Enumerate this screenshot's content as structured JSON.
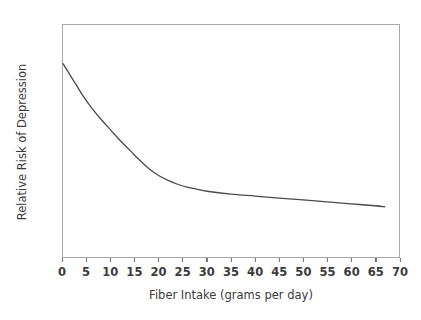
{
  "chart_data": {
    "type": "line",
    "title": "",
    "xlabel": "Fiber Intake (grams per day)",
    "ylabel": "Relative Risk of Depression",
    "xlim": [
      0,
      70
    ],
    "ylim": [
      0.0,
      1.2
    ],
    "xticks": [
      0,
      5,
      10,
      15,
      20,
      25,
      30,
      35,
      40,
      45,
      50,
      55,
      60,
      65,
      70
    ],
    "yticks": [
      "0.0",
      "0.1",
      "0.2",
      "0.3",
      "0.4",
      "0.5",
      "0.6",
      "0.7",
      "0.8",
      "0.9",
      "1.0",
      "1.1",
      "1.2"
    ],
    "xtick_labels": [
      "0",
      "5",
      "10",
      "15",
      "20",
      "25",
      "30",
      "35",
      "40",
      "45",
      "50",
      "55",
      "60",
      "65",
      "70"
    ],
    "grid": false,
    "legend": false,
    "series": [
      {
        "name": "Relative Risk of Depression",
        "color": "#4a4a4a",
        "x": [
          0,
          2,
          4,
          6,
          8,
          10,
          12,
          14,
          16,
          18,
          20,
          22,
          24,
          26,
          28,
          30,
          35,
          40,
          45,
          50,
          55,
          60,
          65,
          67
        ],
        "values": [
          1.0,
          0.92,
          0.84,
          0.77,
          0.71,
          0.655,
          0.6,
          0.55,
          0.5,
          0.455,
          0.42,
          0.395,
          0.375,
          0.36,
          0.35,
          0.34,
          0.325,
          0.315,
          0.305,
          0.295,
          0.285,
          0.275,
          0.265,
          0.26
        ]
      }
    ]
  },
  "axes": {
    "frame_color": "#a9a9ac",
    "tick_color": "#6f6f72",
    "text_color": "#3b3b3b"
  }
}
